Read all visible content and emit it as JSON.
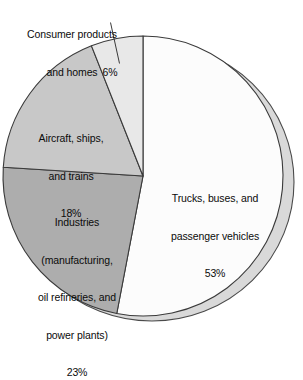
{
  "chart_data": {
    "type": "pie",
    "title": "",
    "subtitle": "",
    "xlabel": "",
    "ylabel": "",
    "legend_position": "none",
    "grid": false,
    "units": "percent",
    "categories": [
      "Trucks, buses, and passenger vehicles",
      "Industries (manufacturing, oil refineries, and power plants)",
      "Aircraft, ships, and trains",
      "Consumer products and homes"
    ],
    "values": [
      53,
      23,
      18,
      6
    ],
    "slices": [
      {
        "key": "trucks",
        "label_lines": [
          "Trucks, buses, and",
          "passenger vehicles",
          "53%"
        ],
        "value": 53,
        "value_text": "53%",
        "color": "#fcfcfc",
        "label_placement": "inside",
        "start_angle_deg": 0,
        "end_angle_deg": 190.8
      },
      {
        "key": "industries",
        "label_lines": [
          "Industries",
          "(manufacturing,",
          "oil refineries, and",
          "power plants)",
          "23%"
        ],
        "value": 23,
        "value_text": "23%",
        "color": "#adadad",
        "label_placement": "inside",
        "start_angle_deg": 190.8,
        "end_angle_deg": 273.6
      },
      {
        "key": "aircraft",
        "label_lines": [
          "Aircraft, ships,",
          "and trains",
          "18%"
        ],
        "value": 18,
        "value_text": "18%",
        "color": "#c8c8c8",
        "label_placement": "inside",
        "start_angle_deg": 273.6,
        "end_angle_deg": 338.4
      },
      {
        "key": "consumer",
        "label_lines": [
          "Consumer products",
          "and homes"
        ],
        "value": 6,
        "value_text": "6%",
        "color": "#e8e8e8",
        "label_placement": "outside-leader",
        "start_angle_deg": 338.4,
        "end_angle_deg": 360
      }
    ],
    "style": {
      "outline_color": "#3a3a3a",
      "shadow_color": "#d9d9d9",
      "shadow_outline_color": "#4a4a4a",
      "background": "#ffffff",
      "text_color": "#0b0b0b",
      "leader_line_color": "#3a3a3a"
    }
  },
  "labels": {
    "consumer": {
      "line1": "Consumer products",
      "line2": "and homes",
      "pct": "6%"
    },
    "aircraft": {
      "line1": "Aircraft, ships,",
      "line2": "and trains",
      "pct": "18%"
    },
    "industries": {
      "line1": "Industries",
      "line2": "(manufacturing,",
      "line3": "oil refineries, and",
      "line4": "power plants)",
      "pct": "23%"
    },
    "trucks": {
      "line1": "Trucks, buses, and",
      "line2": "passenger vehicles",
      "pct": "53%"
    }
  }
}
